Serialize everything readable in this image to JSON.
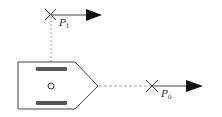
{
  "diagram": {
    "type": "vessel-lookahead-points",
    "points": [
      {
        "id": "p1",
        "label": "P",
        "subscript": "1"
      },
      {
        "id": "p0",
        "label": "P",
        "subscript": "0"
      }
    ],
    "colors": {
      "line": "#444444",
      "bar": "#555555",
      "arrow": "#111111",
      "dashed": "#888888"
    }
  }
}
